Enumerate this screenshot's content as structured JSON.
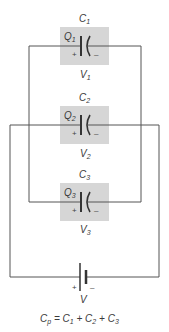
{
  "diagram": {
    "colors": {
      "wire": "#555555",
      "box": "#d6d6d6",
      "text": "#3a3a3a"
    },
    "capacitors": [
      {
        "name": "C",
        "index": "1",
        "charge": "Q",
        "charge_index": "1",
        "voltage": "V",
        "voltage_index": "1",
        "plus": "+",
        "minus": "–"
      },
      {
        "name": "C",
        "index": "2",
        "charge": "Q",
        "charge_index": "2",
        "voltage": "V",
        "voltage_index": "2",
        "plus": "+",
        "minus": "–"
      },
      {
        "name": "C",
        "index": "3",
        "charge": "Q",
        "charge_index": "3",
        "voltage": "V",
        "voltage_index": "3",
        "plus": "+",
        "minus": "–"
      }
    ],
    "battery": {
      "label": "V",
      "plus": "+",
      "minus": "–"
    },
    "formula": {
      "lhs": "C",
      "lhs_sub": "p",
      "eq": " = ",
      "t1": "C",
      "t1_sub": "1",
      "plus1": " + ",
      "t2": "C",
      "t2_sub": "2",
      "plus2": " + ",
      "t3": "C",
      "t3_sub": "3"
    }
  }
}
